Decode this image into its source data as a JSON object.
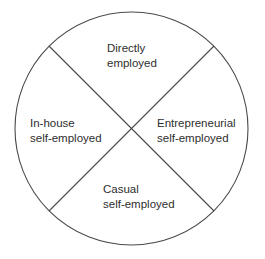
{
  "diagram": {
    "type": "quadrant-circle",
    "stroke_color": "#4a4a4a",
    "text_color": "#2e2e2e",
    "circle": {
      "cx": 131.5,
      "cy": 128.5,
      "r": 116.5
    },
    "quadrants": {
      "top": {
        "line1": "Directly",
        "line2": "employed"
      },
      "left": {
        "line1": "In-house",
        "line2": "self-employed"
      },
      "right": {
        "line1": "Entrepreneurial",
        "line2": "self-employed"
      },
      "bottom": {
        "line1": "Casual",
        "line2": "self-employed"
      }
    }
  }
}
